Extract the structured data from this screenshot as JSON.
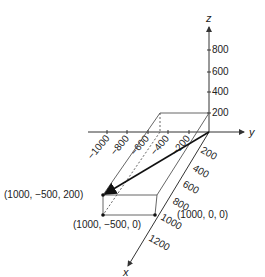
{
  "diagram": {
    "axes": {
      "x_label": "x",
      "y_label": "y",
      "z_label": "z",
      "z_ticks": [
        "200",
        "400",
        "600",
        "800"
      ],
      "y_neg_ticks": [
        "−1000",
        "−800",
        "−600",
        "−400",
        "−200"
      ],
      "x_ticks": [
        "200",
        "400",
        "600",
        "800",
        "1000",
        "1200"
      ]
    },
    "points": {
      "p_top": "(1000, −500, 200)",
      "p_bottom": "(1000, −500, 0)",
      "p_x": "(1000, 0, 0)"
    },
    "colors": {
      "axis": "#333333",
      "box": "#555555",
      "vector": "#111111"
    }
  }
}
